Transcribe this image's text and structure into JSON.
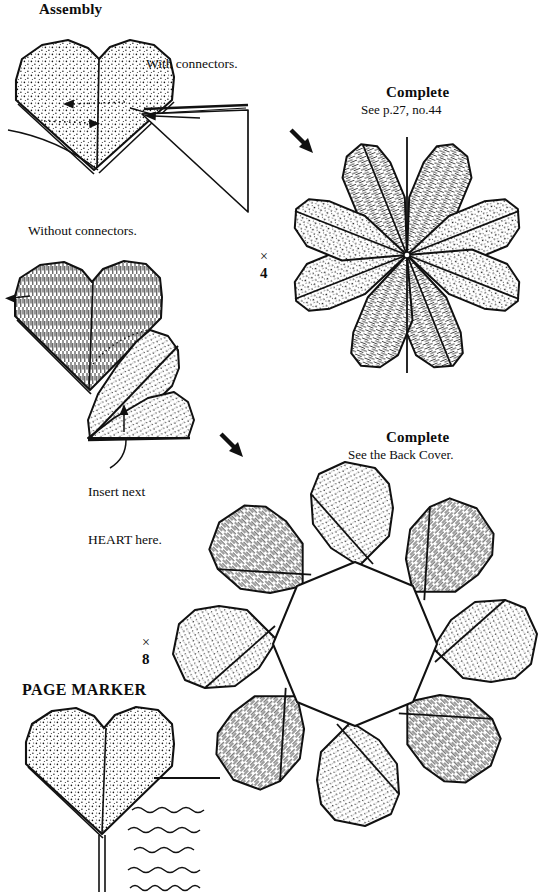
{
  "page": {
    "width": 542,
    "height": 892,
    "background": "#ffffff",
    "ink": "#0d0d0d"
  },
  "labels": {
    "assembly_heading": "Assembly",
    "with_connectors": "With connectors.",
    "without_connectors": "Without connectors.",
    "insert_next_line1": "Insert next",
    "insert_next_line2": "HEART here.",
    "complete_1_heading": "Complete",
    "complete_1_sub": "See p.27, no.44",
    "complete_2_heading": "Complete",
    "complete_2_sub": "See the Back Cover.",
    "page_marker_heading": "PAGE MARKER",
    "multiplier_4": "× 4",
    "multiplier_4_symbol": "×",
    "multiplier_4_count": "4",
    "multiplier_8_symbol": "×",
    "multiplier_8_count": "8"
  },
  "figures": {
    "fig_with_connectors": {
      "name": "heart-with-connectors-diagram",
      "fill": "dotted",
      "has_connector_triangle": true,
      "arrows": [
        "left",
        "right",
        "into-connector"
      ]
    },
    "fig_without_connectors": {
      "name": "two-hearts-without-connectors-diagram",
      "fills": [
        "hatched",
        "dotted"
      ],
      "arrows": [
        "left",
        "up"
      ],
      "callout": "Insert next HEART here."
    },
    "fig_rosette_4": {
      "name": "four-heart-rosette",
      "hearts": 4,
      "petals": 8,
      "center": "closed",
      "fills": [
        "hatched",
        "dotted"
      ]
    },
    "fig_rosette_8": {
      "name": "eight-heart-ring",
      "hearts": 8,
      "center": "open",
      "fills": [
        "hatched",
        "dotted"
      ]
    },
    "fig_page_marker": {
      "name": "page-marker-heart",
      "fill": "dotted",
      "tail": true,
      "squiggle_lines": 5,
      "rule_line": true
    }
  },
  "arrows": {
    "step_arrow_1": {
      "name": "step-arrow-to-rosette-4",
      "direction": "down-right"
    },
    "step_arrow_2": {
      "name": "step-arrow-to-rosette-8",
      "direction": "down-right"
    }
  }
}
